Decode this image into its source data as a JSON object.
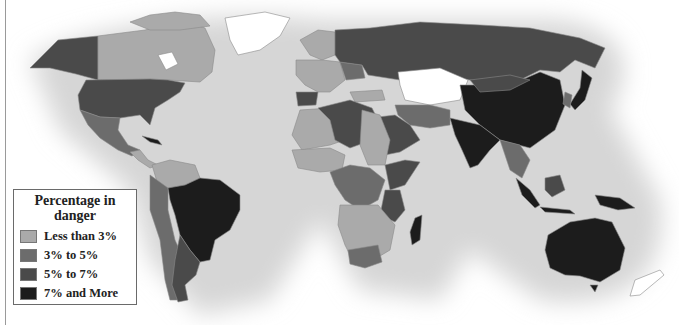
{
  "legend": {
    "title_line1": "Percentage in",
    "title_line2": "danger",
    "items": [
      {
        "label": "Less than 3%",
        "color": "#aaaaaa"
      },
      {
        "label": "3% to 5%",
        "color": "#6c6c6c"
      },
      {
        "label": "5% to 7%",
        "color": "#4a4a4a"
      },
      {
        "label": "7% and More",
        "color": "#1c1c1c"
      }
    ]
  },
  "colors": {
    "no_data": "#ffffff",
    "ocean_shadow": "#d8d8d8",
    "border": "#8a8a8a"
  },
  "regions": [
    {
      "name": "Alaska",
      "category": 2
    },
    {
      "name": "Canada",
      "category": 0
    },
    {
      "name": "Greenland",
      "category": -1
    },
    {
      "name": "United States",
      "category": 2
    },
    {
      "name": "Mexico",
      "category": 1
    },
    {
      "name": "Cuba",
      "category": 3
    },
    {
      "name": "Brazil",
      "category": 3
    },
    {
      "name": "Argentina/Chile",
      "category": 1
    },
    {
      "name": "Russia",
      "category": 2
    },
    {
      "name": "Kazakhstan",
      "category": -1
    },
    {
      "name": "China",
      "category": 3
    },
    {
      "name": "India",
      "category": 3
    },
    {
      "name": "Australia",
      "category": 3
    },
    {
      "name": "New Zealand",
      "category": -1
    },
    {
      "name": "Madagascar",
      "category": 2
    },
    {
      "name": "Algeria/Libya",
      "category": 2
    },
    {
      "name": "Saudi Arabia",
      "category": 2
    },
    {
      "name": "Iran",
      "category": 1
    },
    {
      "name": "Southeast Asia",
      "category": 1
    },
    {
      "name": "Indonesia",
      "category": 2
    }
  ]
}
